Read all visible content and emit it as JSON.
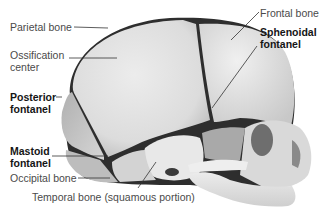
{
  "figure": {
    "labels": {
      "parietal_bone": "Parietal bone",
      "ossification_center_line1": "Ossification",
      "ossification_center_line2": "center",
      "posterior_fontanel_line1": "Posterior",
      "posterior_fontanel_line2": "fontanel",
      "mastoid_fontanel_line1": "Mastoid",
      "mastoid_fontanel_line2": "fontanel",
      "occipital_bone": "Occipital bone",
      "temporal_bone": "Temporal bone (squamous portion)",
      "frontal_bone": "Frontal bone",
      "sphenoidal_fontanel_line1": "Sphenoidal",
      "sphenoidal_fontanel_line2": "fontanel"
    },
    "colors": {
      "bone_light": "#e6e6e6",
      "bone_mid": "#c9c9c9",
      "bone_shadow": "#9e9e9e",
      "fontanel_dark": "#2e2e2e",
      "leader_line": "#333333",
      "label_text": "#4a4a4a",
      "label_bold": "#151515"
    }
  }
}
